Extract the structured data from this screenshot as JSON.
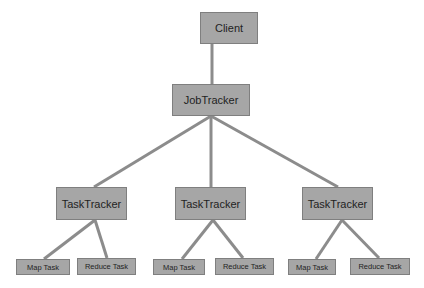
{
  "diagram": {
    "title": "",
    "colors": {
      "node_fill": "#a6a6a6",
      "node_border": "#7f7f7f",
      "edge": "#8c8c8c",
      "text": "#1f1f1f"
    },
    "nodes": [
      {
        "id": "client",
        "label": "Client",
        "x": 200,
        "y": 12,
        "w": 58,
        "h": 32,
        "size": "lg"
      },
      {
        "id": "jobtracker",
        "label": "JobTracker",
        "x": 172,
        "y": 84,
        "w": 78,
        "h": 32,
        "size": "lg"
      },
      {
        "id": "tt1",
        "label": "TaskTracker",
        "x": 56,
        "y": 187,
        "w": 71,
        "h": 33,
        "size": "lg"
      },
      {
        "id": "tt2",
        "label": "TaskTracker",
        "x": 175,
        "y": 187,
        "w": 71,
        "h": 33,
        "size": "lg"
      },
      {
        "id": "tt3",
        "label": "TaskTracker",
        "x": 302,
        "y": 187,
        "w": 71,
        "h": 33,
        "size": "lg"
      },
      {
        "id": "map1",
        "label": "Map Task",
        "x": 16,
        "y": 259,
        "w": 54,
        "h": 16,
        "size": "sm"
      },
      {
        "id": "reduce1",
        "label": "Reduce Task",
        "x": 77,
        "y": 258,
        "w": 59,
        "h": 17,
        "size": "sm"
      },
      {
        "id": "map2",
        "label": "Map Task",
        "x": 153,
        "y": 259,
        "w": 52,
        "h": 16,
        "size": "sm"
      },
      {
        "id": "reduce2",
        "label": "Reduce Task",
        "x": 215,
        "y": 258,
        "w": 59,
        "h": 17,
        "size": "sm"
      },
      {
        "id": "map3",
        "label": "Map Task",
        "x": 288,
        "y": 259,
        "w": 48,
        "h": 16,
        "size": "sm"
      },
      {
        "id": "reduce3",
        "label": "Reduce Task",
        "x": 350,
        "y": 258,
        "w": 60,
        "h": 17,
        "size": "sm"
      }
    ],
    "edges": [
      {
        "from": "client",
        "to": "jobtracker",
        "x1": 212,
        "y1": 44,
        "x2": 212,
        "y2": 84
      },
      {
        "from": "jobtracker",
        "to": "tt1",
        "x1": 211,
        "y1": 116,
        "x2": 94,
        "y2": 187
      },
      {
        "from": "jobtracker",
        "to": "tt2",
        "x1": 211,
        "y1": 116,
        "x2": 211,
        "y2": 187
      },
      {
        "from": "jobtracker",
        "to": "tt3",
        "x1": 211,
        "y1": 116,
        "x2": 338,
        "y2": 187
      },
      {
        "from": "tt1",
        "to": "map1",
        "x1": 95,
        "y1": 220,
        "x2": 44,
        "y2": 259
      },
      {
        "from": "tt1",
        "to": "reduce1",
        "x1": 95,
        "y1": 220,
        "x2": 107,
        "y2": 258
      },
      {
        "from": "tt2",
        "to": "map2",
        "x1": 213,
        "y1": 220,
        "x2": 182,
        "y2": 259
      },
      {
        "from": "tt2",
        "to": "reduce2",
        "x1": 213,
        "y1": 220,
        "x2": 243,
        "y2": 258
      },
      {
        "from": "tt3",
        "to": "map3",
        "x1": 342,
        "y1": 220,
        "x2": 316,
        "y2": 259
      },
      {
        "from": "tt3",
        "to": "reduce3",
        "x1": 342,
        "y1": 220,
        "x2": 379,
        "y2": 258
      }
    ]
  }
}
